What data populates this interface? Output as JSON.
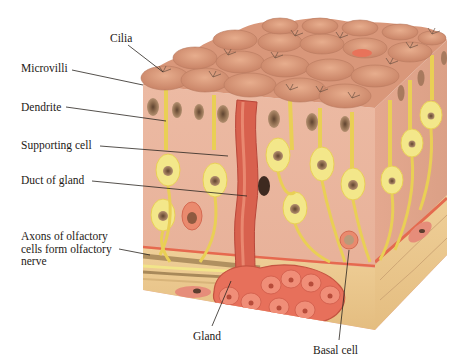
{
  "diagram": {
    "colors": {
      "top_surface": "#d99a78",
      "front_face": "#eab7a1",
      "right_face": "#e2a48b",
      "receptor_cell": "#f3e78a",
      "receptor_outline": "#e8d25a",
      "nucleus": "#8f6a4c",
      "gland": "#e06a57",
      "connective_tissue": "#ecc98f",
      "nerve_band": "#b49762",
      "label_text": "#1e1a16",
      "leader_line": "#2a2520"
    },
    "labels": [
      {
        "id": "cilia",
        "text": "Cilia",
        "x": 110,
        "y": 32,
        "target": [
          163,
          72
        ]
      },
      {
        "id": "microvilli",
        "text": "Microvilli",
        "x": 21,
        "y": 62,
        "target": [
          143,
          85
        ]
      },
      {
        "id": "dendrite",
        "text": "Dendrite",
        "x": 21,
        "y": 101,
        "target": [
          166,
          121
        ]
      },
      {
        "id": "supporting-cell",
        "text": "Supporting cell",
        "x": 21,
        "y": 139,
        "target": [
          228,
          156
        ]
      },
      {
        "id": "duct-of-gland",
        "text": "Duct of gland",
        "x": 21,
        "y": 174,
        "target": [
          247,
          196
        ]
      },
      {
        "id": "axons",
        "text": "Axons of olfactory\ncells form olfactory\nnerve",
        "x": 21,
        "y": 229,
        "target": [
          150,
          255
        ]
      },
      {
        "id": "gland",
        "text": "Gland",
        "x": 193,
        "y": 330,
        "target": [
          231,
          281
        ]
      },
      {
        "id": "basal-cell",
        "text": "Basal cell",
        "x": 313,
        "y": 344,
        "target": [
          349,
          250
        ]
      }
    ]
  }
}
